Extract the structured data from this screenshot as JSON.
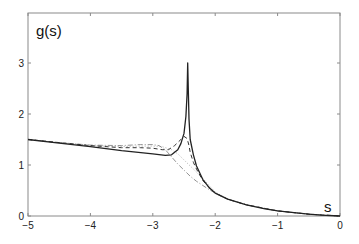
{
  "chart_data": {
    "type": "line",
    "title": "",
    "ylabel": "g(s)",
    "xlabel": "s",
    "xlim": [
      -5,
      0
    ],
    "ylim": [
      0,
      3.2
    ],
    "grid": false,
    "legend": null,
    "xticks": [
      -5,
      -4,
      -3,
      -2,
      -1,
      0
    ],
    "xtick_labels": [
      "-5",
      "-4",
      "-3",
      "-2",
      "-1",
      "0"
    ],
    "yticks": [
      0,
      1,
      2,
      3
    ],
    "ytick_labels": [
      "0",
      "1",
      "2",
      "3"
    ],
    "series": [
      {
        "name": "solid",
        "style": "solid",
        "x": [
          -5,
          -4.5,
          -4,
          -3.5,
          -3,
          -2.8,
          -2.7,
          -2.6,
          -2.55,
          -2.5,
          -2.47,
          -2.45,
          -2.44,
          -2.43,
          -2.42,
          -2.4,
          -2.35,
          -2.3,
          -2.2,
          -2.1,
          -2.0,
          -1.8,
          -1.5,
          -1.2,
          -1.0,
          -0.7,
          -0.5,
          -0.3,
          0
        ],
        "y": [
          1.5,
          1.43,
          1.36,
          1.28,
          1.22,
          1.19,
          1.2,
          1.3,
          1.42,
          1.62,
          1.95,
          2.4,
          3.0,
          2.4,
          1.9,
          1.5,
          1.2,
          0.98,
          0.72,
          0.56,
          0.45,
          0.33,
          0.22,
          0.14,
          0.1,
          0.06,
          0.035,
          0.015,
          0
        ]
      },
      {
        "name": "dashed",
        "style": "dashed",
        "x": [
          -5,
          -4.5,
          -4,
          -3.5,
          -3.2,
          -3.0,
          -2.85,
          -2.75,
          -2.65,
          -2.55,
          -2.5,
          -2.45,
          -2.42,
          -2.4,
          -2.35,
          -2.3,
          -2.2,
          -2.1,
          -2.0,
          -1.8,
          -1.5,
          -1.0,
          -0.5,
          0
        ],
        "y": [
          1.5,
          1.44,
          1.38,
          1.34,
          1.34,
          1.33,
          1.3,
          1.3,
          1.38,
          1.5,
          1.56,
          1.52,
          1.38,
          1.25,
          1.05,
          0.92,
          0.7,
          0.56,
          0.45,
          0.33,
          0.22,
          0.1,
          0.035,
          0
        ]
      },
      {
        "name": "dash-dot",
        "style": "dashdot",
        "x": [
          -5,
          -4.5,
          -4,
          -3.5,
          -3.2,
          -3.0,
          -2.9,
          -2.8,
          -2.7,
          -2.6,
          -2.5,
          -2.4,
          -2.3,
          -2.2,
          -2.1,
          -2.0,
          -1.8,
          -1.5,
          -1.0,
          -0.5,
          0
        ],
        "y": [
          1.5,
          1.44,
          1.39,
          1.38,
          1.4,
          1.4,
          1.38,
          1.3,
          1.16,
          1.02,
          0.9,
          0.78,
          0.68,
          0.6,
          0.52,
          0.45,
          0.33,
          0.22,
          0.1,
          0.035,
          0
        ]
      },
      {
        "name": "dotted",
        "style": "dotted",
        "x": [
          -5,
          -4.5,
          -4,
          -3.5,
          -3.2,
          -3.0,
          -2.85,
          -2.7,
          -2.6,
          -2.5,
          -2.4,
          -2.3,
          -2.2,
          -2.1,
          -2.0,
          -1.8,
          -1.5,
          -1.0,
          -0.5,
          0
        ],
        "y": [
          1.5,
          1.44,
          1.38,
          1.36,
          1.37,
          1.37,
          1.36,
          1.3,
          1.22,
          1.1,
          0.98,
          0.86,
          0.74,
          0.6,
          0.47,
          0.33,
          0.22,
          0.1,
          0.035,
          0
        ]
      }
    ],
    "colors": {
      "axis": "#8a8a8a",
      "line": "#222222"
    }
  }
}
